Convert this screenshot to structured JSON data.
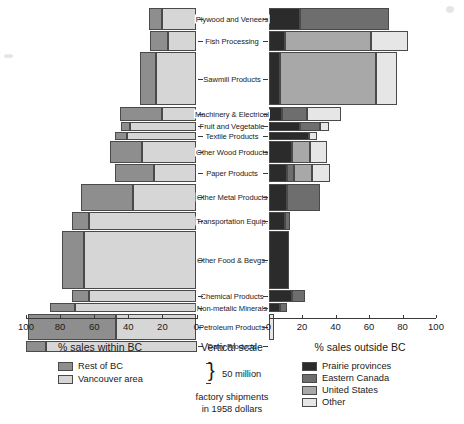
{
  "chart_data": {
    "type": "bar",
    "orientation": "horizontal-diverging-stacked",
    "title": "",
    "subtitle": "",
    "left_panel": {
      "title": "% sales within BC",
      "axis_label": "% sales within BC",
      "ticks": [
        100,
        80,
        60,
        40,
        20,
        0
      ],
      "xlim": [
        100,
        0
      ],
      "series": [
        {
          "name": "Rest of BC",
          "color": "#8e8e8e"
        },
        {
          "name": "Vancouver area",
          "color": "#d6d6d6"
        }
      ]
    },
    "right_panel": {
      "title": "% sales outside BC",
      "axis_label": "% sales outside BC",
      "ticks": [
        0,
        20,
        40,
        60,
        80,
        100
      ],
      "xlim": [
        0,
        100
      ],
      "series": [
        {
          "name": "Prairie provinces",
          "color": "#2b2b2b"
        },
        {
          "name": "Eastern Canada",
          "color": "#6e6e6e"
        },
        {
          "name": "United States",
          "color": "#a8a8a8"
        },
        {
          "name": "Other",
          "color": "#e6e6e6"
        }
      ]
    },
    "vertical_scale": {
      "title": "Vertical scale",
      "bracket_label": "50 million",
      "note_line1": "factory shipments",
      "note_line2": "in 1958 dollars"
    },
    "categories": [
      "Plywood and Veneers",
      "Fish Processing",
      "Sawmill Products",
      "Machinery & Electrical",
      "Fruit and Vegetable",
      "Textile Products",
      "Other Wood Products",
      "Paper Products",
      "Other Metal Products",
      "Transportation Equip.",
      "Other Food & Bevgs.",
      "Chemical Products",
      "Non-metalic Minerals",
      "Petroleum Products",
      "Dairy Products"
    ],
    "rows": [
      {
        "category": "Plywood and Veneers",
        "height_px": 22,
        "within_bc": {
          "Vancouver area": 20,
          "Rest of BC": 8
        },
        "outside_bc": {
          "Prairie provinces": 19,
          "Eastern Canada": 53,
          "United States": 0,
          "Other": 0
        }
      },
      {
        "category": "Fish Processing",
        "height_px": 20,
        "within_bc": {
          "Vancouver area": 17,
          "Rest of BC": 10
        },
        "outside_bc": {
          "Prairie provinces": 10,
          "Eastern Canada": 0,
          "United States": 51,
          "Other": 22
        }
      },
      {
        "category": "Sawmill Products",
        "height_px": 53,
        "within_bc": {
          "Vancouver area": 24,
          "Rest of BC": 9
        },
        "outside_bc": {
          "Prairie provinces": 7,
          "Eastern Canada": 0,
          "United States": 57,
          "Other": 13
        }
      },
      {
        "category": "Machinery & Electrical",
        "height_px": 14,
        "within_bc": {
          "Vancouver area": 20,
          "Rest of BC": 25
        },
        "outside_bc": {
          "Prairie provinces": 8,
          "Eastern Canada": 15,
          "United States": 0,
          "Other": 20
        }
      },
      {
        "category": "Fruit and Vegetable",
        "height_px": 9,
        "within_bc": {
          "Vancouver area": 39,
          "Rest of BC": 5
        },
        "outside_bc": {
          "Prairie provinces": 19,
          "Eastern Canada": 12,
          "United States": 0,
          "Other": 5
        }
      },
      {
        "category": "Textile Products",
        "height_px": 8,
        "within_bc": {
          "Vancouver area": 41,
          "Rest of BC": 7
        },
        "outside_bc": {
          "Prairie provinces": 24,
          "Eastern Canada": 0,
          "United States": 0,
          "Other": 5
        }
      },
      {
        "category": "Other Wood Products",
        "height_px": 22,
        "within_bc": {
          "Vancouver area": 32,
          "Rest of BC": 19
        },
        "outside_bc": {
          "Prairie provinces": 14,
          "Eastern Canada": 0,
          "United States": 11,
          "Other": 10
        }
      },
      {
        "category": "Paper Products",
        "height_px": 18,
        "within_bc": {
          "Vancouver area": 25,
          "Rest of BC": 23
        },
        "outside_bc": {
          "Prairie provinces": 11,
          "Eastern Canada": 4,
          "United States": 11,
          "Other": 11
        }
      },
      {
        "category": "Other Metal Products",
        "height_px": 27,
        "within_bc": {
          "Vancouver area": 37,
          "Rest of BC": 31
        },
        "outside_bc": {
          "Prairie provinces": 11,
          "Eastern Canada": 20,
          "United States": 0,
          "Other": 0
        }
      },
      {
        "category": "Transportation Equip.",
        "height_px": 18,
        "within_bc": {
          "Vancouver area": 63,
          "Rest of BC": 10
        },
        "outside_bc": {
          "Prairie provinces": 10,
          "Eastern Canada": 3,
          "United States": 0,
          "Other": 0
        }
      },
      {
        "category": "Other Food & Bevgs.",
        "height_px": 58,
        "within_bc": {
          "Vancouver area": 66,
          "Rest of BC": 13
        },
        "outside_bc": {
          "Prairie provinces": 12,
          "Eastern Canada": 0,
          "United States": 0,
          "Other": 0
        }
      },
      {
        "category": "Chemical Products",
        "height_px": 12,
        "within_bc": {
          "Vancouver area": 63,
          "Rest of BC": 10
        },
        "outside_bc": {
          "Prairie provinces": 14,
          "Eastern Canada": 8,
          "United States": 0,
          "Other": 0
        }
      },
      {
        "category": "Non-metalic Minerals",
        "height_px": 9,
        "within_bc": {
          "Vancouver area": 71,
          "Rest of BC": 15
        },
        "outside_bc": {
          "Prairie provinces": 7,
          "Eastern Canada": 4,
          "United States": 0,
          "Other": 0
        }
      },
      {
        "category": "Petroleum Products",
        "height_px": 26,
        "within_bc": {
          "Vancouver area": 47,
          "Rest of BC": 52
        },
        "outside_bc": {
          "Prairie provinces": 0,
          "Eastern Canada": 0,
          "United States": 0,
          "Other": 3
        }
      },
      {
        "category": "Dairy Products",
        "height_px": 11,
        "within_bc": {
          "Vancouver area": 88,
          "Rest of BC": 12
        },
        "outside_bc": {
          "Prairie provinces": 0,
          "Eastern Canada": 0,
          "United States": 0,
          "Other": 0
        }
      }
    ]
  }
}
